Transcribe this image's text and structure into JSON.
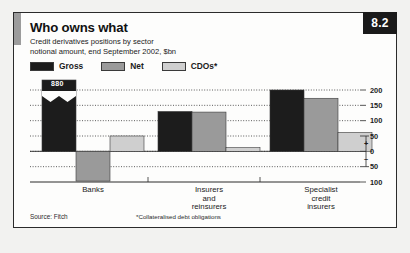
{
  "badge": {
    "number": "8.2"
  },
  "header": {
    "title": "Who owns what",
    "subtitle_line1": "Credit derivatives positions by sector",
    "subtitle_line2": "notional amount, end September 2002, $bn"
  },
  "legend": {
    "items": [
      {
        "label": "Gross",
        "color": "#1c1c1c",
        "icon": "legend-swatch-icon"
      },
      {
        "label": "Net",
        "color": "#9a9a9a",
        "icon": "legend-swatch-icon"
      },
      {
        "label": "CDOs*",
        "color": "#cfcfcf",
        "icon": "legend-swatch-icon"
      }
    ]
  },
  "footer": {
    "source": "Source: Fitch",
    "footnote": "*Collateralised debt obligations"
  },
  "axis": {
    "tick_labels": [
      "200",
      "150",
      "100",
      "50",
      "0",
      "50",
      "100"
    ],
    "positive_sign": "+",
    "negative_sign": "–"
  },
  "annotations": {
    "truncated_bar_value": "880"
  },
  "chart_data": {
    "type": "bar",
    "title": "Who owns what",
    "subtitle": "Credit derivatives positions by sector notional amount, end September 2002, $bn",
    "xlabel": "",
    "ylabel": "$bn",
    "ylim": [
      -100,
      200
    ],
    "yticks": [
      200,
      150,
      100,
      50,
      0,
      -50,
      -100
    ],
    "ytick_labels": [
      "200",
      "150",
      "100",
      "50",
      "0",
      "50",
      "100"
    ],
    "grid": true,
    "grid_style": "dotted-horizontal",
    "legend_position": "top-left",
    "categories": [
      "Banks",
      "Insurers and reinsurers",
      "Specialist credit insurers"
    ],
    "category_labels_multiline": [
      [
        "Banks"
      ],
      [
        "Insurers",
        "and",
        "reinsurers"
      ],
      [
        "Specialist",
        "credit",
        "insurers"
      ]
    ],
    "series": [
      {
        "name": "Gross",
        "color": "#1c1c1c",
        "values": [
          880,
          130,
          200
        ],
        "notes": [
          "axis-broken, labelled 880",
          "",
          ""
        ]
      },
      {
        "name": "Net",
        "color": "#9a9a9a",
        "values": [
          -97,
          128,
          173
        ]
      },
      {
        "name": "CDOs*",
        "color": "#cfcfcf",
        "values": [
          50,
          12,
          62
        ]
      }
    ],
    "annotations": [
      {
        "text": "880",
        "series": "Gross",
        "category": "Banks",
        "type": "value-label-on-broken-bar"
      }
    ],
    "source": "Source: Fitch",
    "footnote": "*Collateralised debt obligations"
  }
}
